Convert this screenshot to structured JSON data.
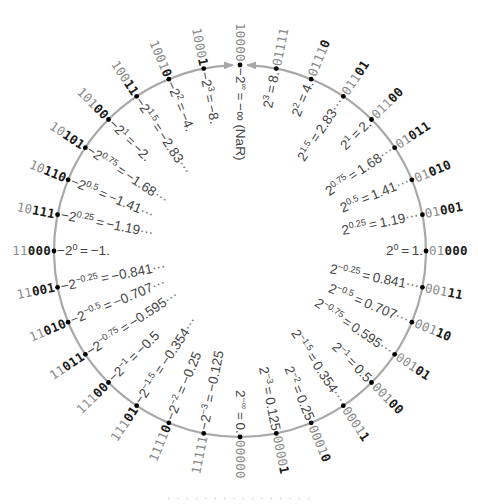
{
  "diagram": {
    "type": "posit-ring",
    "center": [
      240,
      251
    ],
    "radius": 186,
    "ring_color": "#a8a8a8",
    "dot_color": "#000000",
    "bit_gray_color": "#8a8a8a",
    "bit_dark_color": "#1a1a1a",
    "value_color": "#444444",
    "arrow_target": "10000",
    "points": [
      {
        "bits": "00000",
        "gray": 5,
        "base": "2",
        "exp": "-∞",
        "value": "0."
      },
      {
        "bits": "00001",
        "gray": 4,
        "base": "2",
        "exp": "-3",
        "value": "0.125"
      },
      {
        "bits": "00010",
        "gray": 4,
        "base": "2",
        "exp": "-2",
        "value": "0.25"
      },
      {
        "bits": "00011",
        "gray": 4,
        "base": "2",
        "exp": "-1.5",
        "value": "0.354",
        "more": true
      },
      {
        "bits": "00100",
        "gray": 3,
        "base": "2",
        "exp": "-1",
        "value": "0.5"
      },
      {
        "bits": "00101",
        "gray": 3,
        "base": "2",
        "exp": "-0.75",
        "value": "0.595",
        "more": true
      },
      {
        "bits": "00110",
        "gray": 3,
        "base": "2",
        "exp": "-0.5",
        "value": "0.707",
        "more": true
      },
      {
        "bits": "00111",
        "gray": 3,
        "base": "2",
        "exp": "-0.25",
        "value": "0.841",
        "more": true
      },
      {
        "bits": "01000",
        "gray": 2,
        "base": "2",
        "exp": "0",
        "value": "1."
      },
      {
        "bits": "01001",
        "gray": 2,
        "base": "2",
        "exp": "0.25",
        "value": "1.19",
        "more": true
      },
      {
        "bits": "01010",
        "gray": 2,
        "base": "2",
        "exp": "0.5",
        "value": "1.41",
        "more": true
      },
      {
        "bits": "01011",
        "gray": 2,
        "base": "2",
        "exp": "0.75",
        "value": "1.68",
        "more": true
      },
      {
        "bits": "01100",
        "gray": 3,
        "base": "2",
        "exp": "1",
        "value": "2."
      },
      {
        "bits": "01101",
        "gray": 3,
        "base": "2",
        "exp": "1.5",
        "value": "2.83",
        "more": true
      },
      {
        "bits": "01110",
        "gray": 4,
        "base": "2",
        "exp": "2",
        "value": "4."
      },
      {
        "bits": "01111",
        "gray": 5,
        "base": "2",
        "exp": "3",
        "value": "8."
      },
      {
        "bits": "10000",
        "gray": 5,
        "base": "-2",
        "exp": "∞",
        "value": "-∞ (NaR)"
      },
      {
        "bits": "10001",
        "gray": 4,
        "base": "-2",
        "exp": "3",
        "value": "-8."
      },
      {
        "bits": "10010",
        "gray": 4,
        "base": "-2",
        "exp": "2",
        "value": "-4."
      },
      {
        "bits": "10011",
        "gray": 3,
        "base": "-2",
        "exp": "1.5",
        "value": "-2.83",
        "more": true
      },
      {
        "bits": "10100",
        "gray": 3,
        "base": "-2",
        "exp": "1",
        "value": "-2."
      },
      {
        "bits": "10101",
        "gray": 2,
        "base": "-2",
        "exp": "0.75",
        "value": "-1.68",
        "more": true
      },
      {
        "bits": "10110",
        "gray": 2,
        "base": "-2",
        "exp": "0.5",
        "value": "-1.41",
        "more": true
      },
      {
        "bits": "10111",
        "gray": 2,
        "base": "-2",
        "exp": "0.25",
        "value": "-1.19",
        "more": true
      },
      {
        "bits": "11000",
        "gray": 2,
        "base": "-2",
        "exp": "0",
        "value": "-1."
      },
      {
        "bits": "11001",
        "gray": 2,
        "base": "-2",
        "exp": "-0.25",
        "value": "-0.841",
        "more": true
      },
      {
        "bits": "11010",
        "gray": 2,
        "base": "-2",
        "exp": "-0.5",
        "value": "-0.707",
        "more": true
      },
      {
        "bits": "11011",
        "gray": 2,
        "base": "-2",
        "exp": "-0.75",
        "value": "-0.595",
        "more": true
      },
      {
        "bits": "11100",
        "gray": 3,
        "base": "-2",
        "exp": "-1",
        "value": "-0.5"
      },
      {
        "bits": "11101",
        "gray": 3,
        "base": "-2",
        "exp": "-1.5",
        "value": "-0.354",
        "more": true
      },
      {
        "bits": "11110",
        "gray": 4,
        "base": "-2",
        "exp": "-2",
        "value": "-0.25"
      },
      {
        "bits": "11111",
        "gray": 5,
        "base": "-2",
        "exp": "-3",
        "value": "-0.125"
      }
    ]
  },
  "footer": {
    "text": "· · · · ·  ·  · ·  · · · ·  · · ·  ·"
  }
}
